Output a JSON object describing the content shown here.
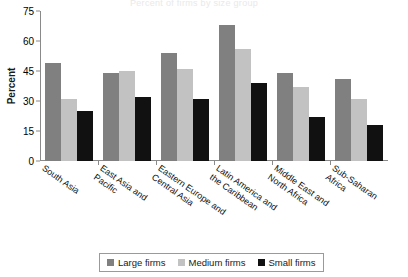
{
  "title_faint": "Percent of firms by size group",
  "chart_data": {
    "type": "bar",
    "title": "",
    "xlabel": "",
    "ylabel": "Percent",
    "ylim": [
      0,
      75
    ],
    "yticks": [
      0,
      15,
      30,
      45,
      60,
      75
    ],
    "grid": false,
    "legend_position": "bottom",
    "categories": [
      "South Asia",
      "East Asia and\nPacific",
      "Eastern Europe and\nCentral Asia",
      "Latin America and\nthe Caribbean",
      "Middle East and\nNorth Africa",
      "Sub-Saharan\nAfrica"
    ],
    "series": [
      {
        "name": "Large firms",
        "color": "#808080",
        "values": [
          49,
          44,
          54,
          68,
          44,
          41
        ]
      },
      {
        "name": "Medium firms",
        "color": "#c2c2c2",
        "values": [
          31,
          45,
          46,
          56,
          37,
          31
        ]
      },
      {
        "name": "Small firms",
        "color": "#111111",
        "values": [
          25,
          32,
          31,
          39,
          22,
          18
        ]
      }
    ]
  }
}
